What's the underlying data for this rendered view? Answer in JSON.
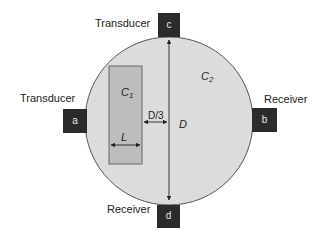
{
  "diagram": {
    "type": "cross-section measurement setup",
    "medium": {
      "label_main": "C",
      "label_sub": "2",
      "fill": "#dcdcdc",
      "stroke": "#555555"
    },
    "inclusion": {
      "label_main": "C",
      "label_sub": "1",
      "fill": "#bdbdbd",
      "stroke": "#666666",
      "width_label": "L",
      "offset_label": "D/3"
    },
    "diameter_label": "D",
    "sensors": [
      {
        "id": "a",
        "role": "Transducer",
        "position": "left"
      },
      {
        "id": "b",
        "role": "Receiver",
        "position": "right"
      },
      {
        "id": "c",
        "role": "Transducer",
        "position": "top"
      },
      {
        "id": "d",
        "role": "Receiver",
        "position": "bottom"
      }
    ],
    "sensor_color": "#2b2b2b"
  }
}
